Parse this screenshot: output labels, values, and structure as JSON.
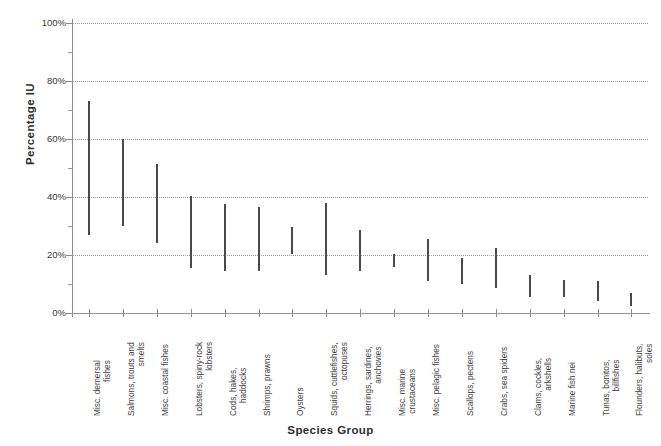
{
  "chart_data": {
    "type": "bar",
    "title": "",
    "subtitle": "",
    "xlabel": "Species Group",
    "ylabel": "Percentage IU",
    "ylim": [
      0,
      100
    ],
    "xlim": [
      0,
      18
    ],
    "grid": true,
    "legend": false,
    "legend_position": "none",
    "y_unit": "%",
    "y_tick_labels": [
      "100%",
      "80%",
      "60%",
      "40%",
      "20%",
      "0%"
    ],
    "y_tick_values": [
      100,
      80,
      60,
      40,
      20,
      0
    ],
    "y_minor_tick_values": [
      90,
      70,
      50,
      30,
      10
    ],
    "note": "Each category is drawn as a vertical range bar spanning from a low value to a high value.",
    "categories": [
      "Misc. demersal fishes",
      "Salmons, trouts and smelts",
      "Misc. coastal fishes",
      "Lobsters, spiny-rock lobsters",
      "Cods, hakes, haddocks",
      "Shrimps, prawns",
      "Oysters",
      "Squids, cuttlefishes, octopuses",
      "Herrings, sardines, anchovies",
      "Misc. marine crustaceans",
      "Misc. pelagic fishes",
      "Scallops, pectens",
      "Crabs, sea spiders",
      "Clams, cockles, arkshells",
      "Marine fish nei",
      "Tunas, bonitos, billfishes",
      "Flounders, halibuts, soles"
    ],
    "category_lines": [
      [
        "Misc. demersal",
        "fishes"
      ],
      [
        "Salmons, trouts and",
        "smelts"
      ],
      [
        "Misc. coastal fishes"
      ],
      [
        "Lobsters, spiny-rock",
        "lobsters"
      ],
      [
        "Cods, hakes,",
        "haddocks"
      ],
      [
        "Shrimps, prawns"
      ],
      [
        "Oysters"
      ],
      [
        "Squids, cuttlefishes,",
        "octopuses"
      ],
      [
        "Herrings, sardines,",
        "anchovies"
      ],
      [
        "Misc. marine",
        "crustaceans"
      ],
      [
        "Misc. pelagic fishes"
      ],
      [
        "Scallops, pectens"
      ],
      [
        "Crabs, sea spiders"
      ],
      [
        "Clams, cockles,",
        "arkshells"
      ],
      [
        "Marine fish nei"
      ],
      [
        "Tunas, bonitos,",
        "billfishes"
      ],
      [
        "Flounders, halibuts,",
        "soles"
      ]
    ],
    "series": [
      {
        "name": "Percentage IU range",
        "low": [
          27,
          30,
          24,
          15.5,
          14.5,
          14.5,
          20.5,
          13,
          14.5,
          16,
          11,
          10,
          8.5,
          5.5,
          5.5,
          4,
          2.5
        ],
        "high": [
          73,
          60,
          51.5,
          40.5,
          37.5,
          36.5,
          29.5,
          38,
          28.5,
          20.5,
          25.5,
          19,
          22.5,
          13,
          11.5,
          11,
          7
        ]
      }
    ],
    "values": [
      {
        "category": "Misc. demersal fishes",
        "low": 27,
        "high": 73
      },
      {
        "category": "Salmons, trouts and smelts",
        "low": 30,
        "high": 60
      },
      {
        "category": "Misc. coastal fishes",
        "low": 24,
        "high": 51.5
      },
      {
        "category": "Lobsters, spiny-rock lobsters",
        "low": 15.5,
        "high": 40.5
      },
      {
        "category": "Cods, hakes, haddocks",
        "low": 14.5,
        "high": 37.5
      },
      {
        "category": "Shrimps, prawns",
        "low": 14.5,
        "high": 36.5
      },
      {
        "category": "Oysters",
        "low": 20.5,
        "high": 29.5
      },
      {
        "category": "Squids, cuttlefishes, octopuses",
        "low": 13,
        "high": 38
      },
      {
        "category": "Herrings, sardines, anchovies",
        "low": 14.5,
        "high": 28.5
      },
      {
        "category": "Misc. marine crustaceans",
        "low": 16,
        "high": 20.5
      },
      {
        "category": "Misc. pelagic fishes",
        "low": 11,
        "high": 25.5
      },
      {
        "category": "Scallops, pectens",
        "low": 10,
        "high": 19
      },
      {
        "category": "Crabs, sea spiders",
        "low": 8.5,
        "high": 22.5
      },
      {
        "category": "Clams, cockles, arkshells",
        "low": 5.5,
        "high": 13
      },
      {
        "category": "Marine fish nei",
        "low": 5.5,
        "high": 11.5
      },
      {
        "category": "Tunas, bonitos, billfishes",
        "low": 4,
        "high": 11
      },
      {
        "category": "Flounders, halibuts, soles",
        "low": 2.5,
        "high": 7
      }
    ],
    "colors": {
      "bar": "#4a4a4a",
      "grid": "#9b9b9b",
      "axis": "#8d8d8d",
      "text": "#3a3a3a",
      "background": "#ffffff"
    }
  }
}
